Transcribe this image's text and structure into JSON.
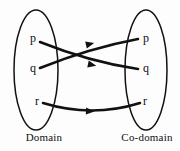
{
  "figure": {
    "type": "mapping-diagram",
    "background_color": "#fdfdfd",
    "stroke_color": "#111111",
    "title": ""
  },
  "domain": {
    "label": "Domain",
    "elements": [
      {
        "name": "p",
        "text": "p",
        "x": 33,
        "y": 38
      },
      {
        "name": "q",
        "text": "q",
        "x": 33,
        "y": 68
      },
      {
        "name": "r",
        "text": "r",
        "x": 37,
        "y": 101
      }
    ]
  },
  "codomain": {
    "label": "Co-domain",
    "elements": [
      {
        "name": "p",
        "text": "p",
        "x": 145,
        "y": 38
      },
      {
        "name": "q",
        "text": "q",
        "x": 145,
        "y": 68
      },
      {
        "name": "r",
        "text": "r",
        "x": 145,
        "y": 101
      }
    ]
  },
  "mappings": [
    {
      "from": "p",
      "to": "q",
      "arrow": true
    },
    {
      "from": "q",
      "to": "p",
      "arrow": true
    },
    {
      "from": "r",
      "to": "r",
      "arrow": true
    }
  ]
}
